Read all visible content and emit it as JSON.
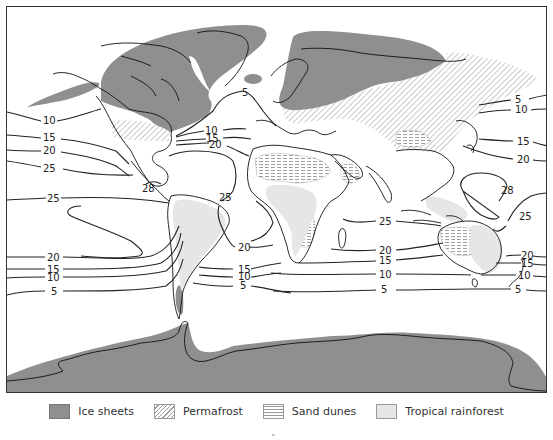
{
  "map": {
    "title": "Last Glacial Maximum: ice sheets, permafrost, sand dunes, tropical rainforest and sea-surface temperature isotherms",
    "colors": {
      "ice": "#8f8f8f",
      "permafrost_hatch": "#999999",
      "sand_hatch": "#999999",
      "rainforest": "#e6e6e6",
      "contour": "#222222",
      "frame": "#333333"
    },
    "contour_labels": {
      "north_atlantic_5": "5",
      "north_atlantic_10": "10",
      "north_atlantic_15": "15",
      "north_atlantic_20": "20",
      "pacific_ne_10": "10",
      "pacific_ne_15": "15",
      "pacific_ne_20": "20",
      "pacific_ne_25": "25",
      "caribbean_28": "28",
      "atlantic_tropic_25": "25",
      "pacific_e_25": "25",
      "pacific_se_20": "20",
      "pacific_se_15": "15",
      "pacific_se_10": "10",
      "pacific_se_5": "5",
      "south_atlantic_20": "20",
      "south_atlantic_15": "15",
      "south_atlantic_10": "10",
      "south_atlantic_5": "5",
      "indian_25": "25",
      "indian_20": "20",
      "indian_15": "15",
      "indian_10": "10",
      "indian_5": "5",
      "pacific_nw_5": "5",
      "pacific_nw_10": "10",
      "pacific_nw_15": "15",
      "pacific_nw_20": "20",
      "pacific_w_28": "28",
      "pacific_w_25": "25",
      "tasman_20": "20",
      "tasman_15": "15",
      "tasman_10": "10",
      "tasman_5": "5"
    }
  },
  "legend": {
    "items": [
      {
        "label": "Ice sheets",
        "pattern": "solid-gray"
      },
      {
        "label": "Permafrost",
        "pattern": "diagonal-hatch"
      },
      {
        "label": "Sand dunes",
        "pattern": "horizontal-dash"
      },
      {
        "label": "Tropical rainforest",
        "pattern": "light-gray"
      }
    ]
  }
}
